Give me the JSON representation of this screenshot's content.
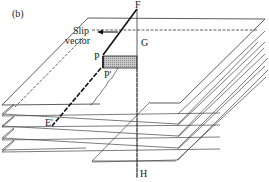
{
  "figure": {
    "panel_label": "(b)",
    "labels": {
      "F": "F",
      "G": "G",
      "H": "H",
      "P": "P",
      "P_prime": "P'",
      "E_prime": "E'",
      "slip_line1": "Slip",
      "slip_line2": "vector"
    },
    "colors": {
      "line": "#333333",
      "shade": "#b8b8b8",
      "background": "#ffffff"
    },
    "plane_count": 5
  }
}
